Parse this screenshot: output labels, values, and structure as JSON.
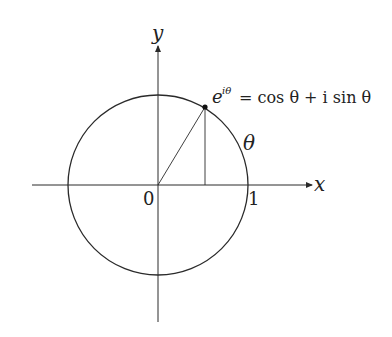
{
  "diagram": {
    "axes": {
      "x_label": "x",
      "y_label": "y",
      "origin_label": "0",
      "unit_label": "1"
    },
    "angle_label": "θ",
    "formula": {
      "lhs_base": "e",
      "lhs_exponent": "iθ",
      "rhs": "= cos θ + i sin θ"
    },
    "colors": {
      "stroke": "#2a2a2a",
      "background": "#ffffff"
    }
  }
}
